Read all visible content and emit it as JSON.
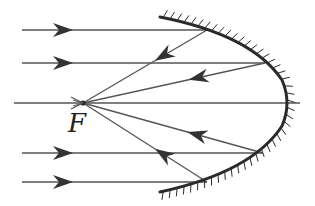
{
  "diagram": {
    "type": "concave-mirror-ray-diagram",
    "focus_label": "F",
    "colors": {
      "ray": "#555555",
      "mirror": "#2a2a2a",
      "arrow": "#333333",
      "label": "#222222"
    },
    "focus_point": {
      "x": 83,
      "y": 103
    },
    "axis": {
      "x1": 14,
      "y1": 103,
      "x2": 300,
      "y2": 103
    },
    "mirror": {
      "path": "M160,17 Q252,35 282,80 Q292,103 282,126 Q252,172 160,192",
      "vertex": {
        "x": 290,
        "y": 103
      }
    },
    "incident_rays": [
      {
        "y": 30,
        "x_start": 22,
        "x_hit": 207,
        "hit_y": 30
      },
      {
        "y": 63,
        "x_start": 22,
        "x_hit": 265,
        "hit_y": 63
      },
      {
        "y": 153,
        "x_start": 22,
        "x_hit": 263,
        "hit_y": 153
      },
      {
        "y": 182,
        "x_start": 22,
        "x_hit": 207,
        "hit_y": 182
      }
    ],
    "reflected_rays": [
      {
        "from": {
          "x": 207,
          "y": 30
        },
        "to": {
          "x": 83,
          "y": 103
        }
      },
      {
        "from": {
          "x": 265,
          "y": 63
        },
        "to": {
          "x": 83,
          "y": 103
        }
      },
      {
        "from": {
          "x": 263,
          "y": 153
        },
        "to": {
          "x": 83,
          "y": 103
        }
      },
      {
        "from": {
          "x": 207,
          "y": 182
        },
        "to": {
          "x": 83,
          "y": 103
        }
      }
    ]
  }
}
